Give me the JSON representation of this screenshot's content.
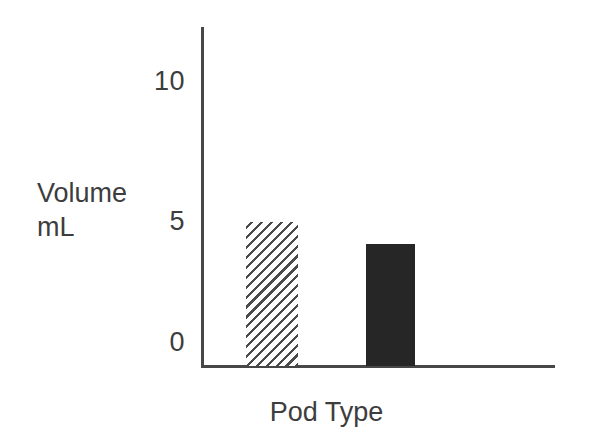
{
  "chart_data": {
    "type": "bar",
    "title": "",
    "subtitle": "",
    "xlabel": "Pod Type",
    "ylabel": "Volume\nmL",
    "ylabel_lines": [
      "Volume",
      "mL"
    ],
    "categories": [
      "Hatched pod",
      "Solid pod"
    ],
    "values": [
      5.0,
      4.1
    ],
    "series": [
      {
        "name": "Volume",
        "values": [
          5.0,
          4.1
        ]
      }
    ],
    "ylim": [
      0,
      11.6
    ],
    "ytick_labels": [
      "0",
      "5",
      "10"
    ],
    "ytick_values": [
      0,
      5,
      10
    ],
    "xtick_labels": [],
    "grid": false,
    "legend": null,
    "annotations": [],
    "bar_styles": [
      "diagonal-hatch",
      "solid-black"
    ],
    "colors": {
      "axis": "#474747",
      "text": "#3d3d3d",
      "bar_hatch_line": "#4a4a4a",
      "bar_hatch_fill": "#ffffff",
      "bar_solid": "#262626",
      "background": "#ffffff"
    }
  },
  "axes": {
    "y_title_line1": "Volume",
    "y_title_line2": "mL",
    "x_title": "Pod Type",
    "ticks": {
      "t10": "10",
      "t5": "5",
      "t0": "0"
    }
  }
}
